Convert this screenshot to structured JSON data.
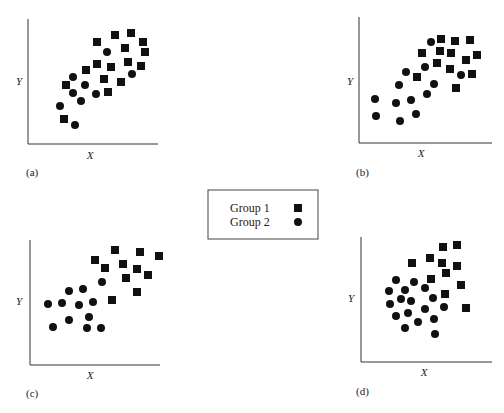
{
  "chart_data": [
    {
      "type": "scatter",
      "panel": "(a)",
      "xlabel": "X",
      "ylabel": "Y",
      "grid": false,
      "series": [
        {
          "name": "Group 1",
          "marker": "square",
          "points": [
            [
              97,
              42
            ],
            [
              115,
              35
            ],
            [
              131,
              33
            ],
            [
              143,
              42
            ],
            [
              145,
              52
            ],
            [
              125,
              48
            ],
            [
              128,
              62
            ],
            [
              141,
              66
            ],
            [
              97,
              64
            ],
            [
              111,
              67
            ],
            [
              86,
              70
            ],
            [
              104,
              79
            ],
            [
              121,
              82
            ],
            [
              108,
              92
            ],
            [
              66,
              85
            ],
            [
              64,
              119
            ]
          ]
        },
        {
          "name": "Group 2",
          "marker": "circle",
          "points": [
            [
              107,
              52
            ],
            [
              73,
              77
            ],
            [
              85,
              85
            ],
            [
              73,
              93
            ],
            [
              81,
              101
            ],
            [
              96,
              94
            ],
            [
              132,
              74
            ],
            [
              60,
              106
            ],
            [
              75,
              125
            ]
          ]
        }
      ]
    },
    {
      "type": "scatter",
      "panel": "(b)",
      "xlabel": "X",
      "ylabel": "Y",
      "grid": false,
      "series": [
        {
          "name": "Group 1",
          "marker": "square",
          "points": [
            [
              441,
              39
            ],
            [
              455,
              41
            ],
            [
              470,
              40
            ],
            [
              422,
              53
            ],
            [
              440,
              51
            ],
            [
              451,
              53
            ],
            [
              477,
              55
            ],
            [
              466,
              60
            ],
            [
              437,
              63
            ],
            [
              450,
              69
            ],
            [
              472,
              74
            ],
            [
              417,
              77
            ],
            [
              456,
              88
            ]
          ]
        },
        {
          "name": "Group 2",
          "marker": "circle",
          "points": [
            [
              431,
              42
            ],
            [
              425,
              67
            ],
            [
              406,
              72
            ],
            [
              461,
              75
            ],
            [
              399,
              85
            ],
            [
              434,
              84
            ],
            [
              427,
              94
            ],
            [
              375,
              99
            ],
            [
              411,
              100
            ],
            [
              396,
              103
            ],
            [
              376,
              116
            ],
            [
              416,
              114
            ],
            [
              400,
              121
            ]
          ]
        }
      ]
    },
    {
      "type": "scatter",
      "panel": "(c)",
      "xlabel": "X",
      "ylabel": "Y",
      "grid": false,
      "series": [
        {
          "name": "Group 1",
          "marker": "square",
          "points": [
            [
              115,
              250
            ],
            [
              140,
              252
            ],
            [
              159,
              256
            ],
            [
              95,
              260
            ],
            [
              123,
              264
            ],
            [
              105,
              268
            ],
            [
              137,
              269
            ],
            [
              148,
              275
            ],
            [
              126,
              278
            ],
            [
              137,
              292
            ],
            [
              112,
              300
            ]
          ]
        },
        {
          "name": "Group 2",
          "marker": "circle",
          "points": [
            [
              102,
              282
            ],
            [
              69,
              291
            ],
            [
              83,
              289
            ],
            [
              48,
              304
            ],
            [
              62,
              303
            ],
            [
              79,
              305
            ],
            [
              93,
              302
            ],
            [
              89,
              317
            ],
            [
              69,
              320
            ],
            [
              53,
              327
            ],
            [
              87,
              328
            ],
            [
              101,
              328
            ]
          ]
        }
      ]
    },
    {
      "type": "scatter",
      "panel": "(d)",
      "xlabel": "X",
      "ylabel": "Y",
      "grid": false,
      "series": [
        {
          "name": "Group 1",
          "marker": "square",
          "points": [
            [
              443,
              247
            ],
            [
              457,
              245
            ],
            [
              412,
              263
            ],
            [
              430,
              258
            ],
            [
              442,
              263
            ],
            [
              457,
              266
            ],
            [
              446,
              273
            ],
            [
              431,
              279
            ],
            [
              461,
              285
            ],
            [
              445,
              294
            ],
            [
              466,
              308
            ]
          ]
        },
        {
          "name": "Group 2",
          "marker": "circle",
          "points": [
            [
              396,
              280
            ],
            [
              414,
              282
            ],
            [
              389,
              291
            ],
            [
              405,
              290
            ],
            [
              425,
              288
            ],
            [
              401,
              299
            ],
            [
              411,
              301
            ],
            [
              433,
              298
            ],
            [
              390,
              304
            ],
            [
              425,
              309
            ],
            [
              444,
              307
            ],
            [
              408,
              313
            ],
            [
              396,
              316
            ],
            [
              434,
              319
            ],
            [
              418,
              322
            ],
            [
              405,
              328
            ],
            [
              435,
              334
            ]
          ]
        }
      ]
    }
  ],
  "panels": [
    {
      "id": "a",
      "caption": "(a)",
      "xlabel": "X",
      "ylabel": "Y",
      "axis": {
        "x0": 28,
        "y0": 144,
        "x1": 158,
        "ytop": 19
      },
      "capxy": [
        26,
        176
      ],
      "xlxy": [
        90,
        159
      ],
      "ylxy": [
        19,
        85
      ]
    },
    {
      "id": "b",
      "caption": "(b)",
      "xlabel": "X",
      "ylabel": "Y",
      "axis": {
        "x0": 359,
        "y0": 143,
        "x1": 492,
        "ytop": 17
      },
      "capxy": [
        356,
        176
      ],
      "xlxy": [
        421,
        157
      ],
      "ylxy": [
        350,
        85
      ]
    },
    {
      "id": "c",
      "caption": "(c)",
      "xlabel": "X",
      "ylabel": "Y",
      "axis": {
        "x0": 30,
        "y0": 365,
        "x1": 160,
        "ytop": 240
      },
      "capxy": [
        26,
        397
      ],
      "xlxy": [
        90,
        379
      ],
      "ylxy": [
        19,
        305
      ]
    },
    {
      "id": "d",
      "caption": "(d)",
      "xlabel": "X",
      "ylabel": "Y",
      "axis": {
        "x0": 361,
        "y0": 362,
        "x1": 492,
        "ytop": 237
      },
      "capxy": [
        356,
        395
      ],
      "xlxy": [
        424,
        376
      ],
      "ylxy": [
        351,
        302
      ]
    }
  ],
  "legend": {
    "box": {
      "x": 208,
      "y": 190,
      "w": 110,
      "h": 49
    },
    "items": [
      {
        "label": "Group 1",
        "marker": "square"
      },
      {
        "label": "Group 2",
        "marker": "circle"
      }
    ]
  }
}
